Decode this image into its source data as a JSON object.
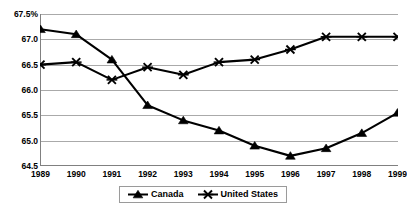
{
  "chart_data": {
    "type": "line",
    "title": "",
    "xlabel": "",
    "ylabel": "",
    "categories": [
      "1989",
      "1990",
      "1991",
      "1992",
      "1993",
      "1994",
      "1995",
      "1996",
      "1997",
      "1998",
      "1999"
    ],
    "x": [
      1989,
      1990,
      1991,
      1992,
      1993,
      1994,
      1995,
      1996,
      1997,
      1998,
      1999
    ],
    "series": [
      {
        "name": "Canada",
        "marker": "filled-triangle",
        "color": "#000000",
        "values": [
          67.2,
          67.1,
          66.6,
          65.7,
          65.4,
          65.2,
          64.9,
          64.7,
          64.85,
          65.15,
          65.55
        ]
      },
      {
        "name": "United States",
        "marker": "x-cross",
        "color": "#000000",
        "values": [
          66.5,
          66.55,
          66.2,
          66.45,
          66.3,
          66.55,
          66.6,
          66.8,
          67.05,
          67.05,
          67.05
        ]
      }
    ],
    "ylim": [
      64.5,
      67.5
    ],
    "y_ticks": [
      64.5,
      65.0,
      65.5,
      66.0,
      66.5,
      67.0,
      67.5
    ],
    "y_tick_labels": [
      "64.5",
      "65.0",
      "65.5",
      "66.0",
      "66.5",
      "67.0",
      "67.5%"
    ],
    "grid": true,
    "grid_axis": "y",
    "grid_color": "#aaaaaa",
    "legend_position": "bottom-center",
    "legend_entries": [
      "Canada",
      "United States"
    ],
    "axis_color": "#808080",
    "plot_background": "#ffffff"
  }
}
